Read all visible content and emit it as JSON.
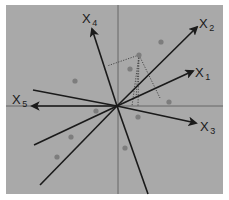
{
  "diagram": {
    "title": "",
    "type": "biplot-projection",
    "colors": {
      "background": "#ffffff",
      "plot_area": "#a9a9a9",
      "axis_line": "#555555",
      "vector": "#1a1a1a",
      "point": "#7d7d7d",
      "projection": "#4a4a4a"
    },
    "plot_area": {
      "x": 6,
      "y": 5,
      "width": 217,
      "height": 189
    },
    "origin": {
      "x": 117,
      "y": 106
    },
    "reference_axes": {
      "horizontal": {
        "x1": 6,
        "y1": 106,
        "x2": 223,
        "y2": 106
      },
      "vertical": {
        "x1": 118,
        "y1": 5,
        "x2": 118,
        "y2": 194
      }
    },
    "vectors": [
      {
        "id": "x1",
        "label_main": "X",
        "label_sub": "1",
        "tip": {
          "x": 193,
          "y": 71
        },
        "label_pos": {
          "x": 195,
          "y": 77
        },
        "arrow": true
      },
      {
        "id": "x2",
        "label_main": "X",
        "label_sub": "2",
        "tip": {
          "x": 197,
          "y": 27
        },
        "label_pos": {
          "x": 199,
          "y": 28
        },
        "arrow": true
      },
      {
        "id": "x3",
        "label_main": "X",
        "label_sub": "3",
        "tip": {
          "x": 196,
          "y": 123
        },
        "label_pos": {
          "x": 200,
          "y": 131
        },
        "arrow": true
      },
      {
        "id": "x4",
        "label_main": "X",
        "label_sub": "4",
        "tip": {
          "x": 92,
          "y": 29
        },
        "label_pos": {
          "x": 82,
          "y": 23
        },
        "arrow": true
      },
      {
        "id": "x5",
        "label_main": "X",
        "label_sub": "5",
        "tip": {
          "x": 32,
          "y": 106
        },
        "label_pos": {
          "x": 12,
          "y": 104
        },
        "arrow": true
      }
    ],
    "extra_lines": [
      {
        "id": "line-upper-left",
        "end": {
          "x": 33,
          "y": 90
        }
      },
      {
        "id": "line-lower-left-1",
        "end": {
          "x": 34,
          "y": 145
        }
      },
      {
        "id": "line-lower-left-2",
        "end": {
          "x": 40,
          "y": 185
        }
      },
      {
        "id": "line-lower-right",
        "end": {
          "x": 148,
          "y": 194
        }
      }
    ],
    "points": [
      {
        "id": "p1",
        "x": 161,
        "y": 42
      },
      {
        "id": "p2",
        "x": 130,
        "y": 69
      },
      {
        "id": "p3",
        "x": 75,
        "y": 81
      },
      {
        "id": "p4",
        "x": 169,
        "y": 102
      },
      {
        "id": "p5",
        "x": 96,
        "y": 111
      },
      {
        "id": "p6",
        "x": 138,
        "y": 117
      },
      {
        "id": "p7",
        "x": 71,
        "y": 137
      },
      {
        "id": "p8",
        "x": 125,
        "y": 148
      },
      {
        "id": "p9",
        "x": 57,
        "y": 157
      }
    ],
    "projected_point": {
      "x": 139,
      "y": 55,
      "projections": [
        {
          "x": 107,
          "y": 66
        },
        {
          "x": 136,
          "y": 99
        },
        {
          "x": 132,
          "y": 106
        },
        {
          "x": 138,
          "y": 106
        },
        {
          "x": 160,
          "y": 98
        }
      ]
    }
  }
}
